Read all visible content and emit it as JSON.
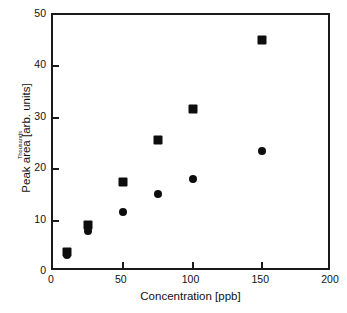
{
  "chart_data": {
    "type": "scatter",
    "title": "",
    "xlabel": "Concentration [ppb]",
    "ylabel": "Peak area [arb. units]",
    "y_unit_note": "Thousands",
    "xlim": [
      0,
      200
    ],
    "ylim": [
      0,
      50
    ],
    "xticks": [
      0,
      50,
      100,
      150,
      200
    ],
    "yticks": [
      0,
      10,
      20,
      30,
      40,
      50
    ],
    "xtick_labels": [
      "0",
      "50",
      "100",
      "150",
      "200"
    ],
    "ytick_labels": [
      "0",
      "10",
      "20",
      "30",
      "40",
      "50"
    ],
    "grid": false,
    "legend": false,
    "legend_position": "none",
    "series": [
      {
        "name": "square-series",
        "marker": "square",
        "color": "#0d0d0d",
        "x": [
          10,
          25,
          50,
          75,
          100,
          150
        ],
        "values": [
          3.8,
          9.2,
          17.5,
          25.7,
          31.7,
          45.2
        ]
      },
      {
        "name": "circle-series",
        "marker": "circle",
        "color": "#0d0d0d",
        "x": [
          10,
          25,
          50,
          75,
          100,
          150
        ],
        "values": [
          3.3,
          7.9,
          11.6,
          15.2,
          18.0,
          23.5
        ]
      }
    ]
  },
  "colors": {
    "axis": "#1a1a1a",
    "marker": "#0d0d0d",
    "background": "#ffffff"
  }
}
